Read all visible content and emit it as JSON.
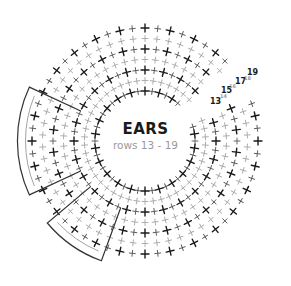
{
  "diagram": {
    "title": "EARS",
    "subtitle": "rows 13 - 19",
    "center": [
      145,
      141
    ],
    "inner_radius": 44,
    "row_spacing": 10.5,
    "rows": [
      13,
      14,
      15,
      16,
      17,
      18,
      19
    ],
    "columns": 44,
    "gap_start_deg": -42,
    "gap_end_deg": -22,
    "row_labels": [
      {
        "text": "13",
        "x": 210,
        "y": 104,
        "size": 8,
        "color": "#1a1a1a"
      },
      {
        "text": "14",
        "x": 220,
        "y": 98,
        "size": 5,
        "color": "#9a9a9a"
      },
      {
        "text": "15",
        "x": 221,
        "y": 93,
        "size": 8,
        "color": "#1a1a1a"
      },
      {
        "text": "16",
        "x": 229,
        "y": 88,
        "size": 5,
        "color": "#9a9a9a"
      },
      {
        "text": "17",
        "x": 235,
        "y": 84,
        "size": 8,
        "color": "#1a1a1a"
      },
      {
        "text": "18",
        "x": 244,
        "y": 80,
        "size": 5,
        "color": "#9a9a9a"
      },
      {
        "text": "19",
        "x": 247,
        "y": 75,
        "size": 8,
        "color": "#1a1a1a"
      }
    ],
    "flaps": [
      {
        "name": "left-ear-flap",
        "from_deg": 155,
        "to_deg": 205
      },
      {
        "name": "bottom-ear-flap",
        "from_deg": 110,
        "to_deg": 140
      }
    ],
    "colors": {
      "odd_row": "#1a1a1a",
      "even_row": "#a8a8a8",
      "outline": "#333333",
      "outline_light": "#999999"
    }
  }
}
